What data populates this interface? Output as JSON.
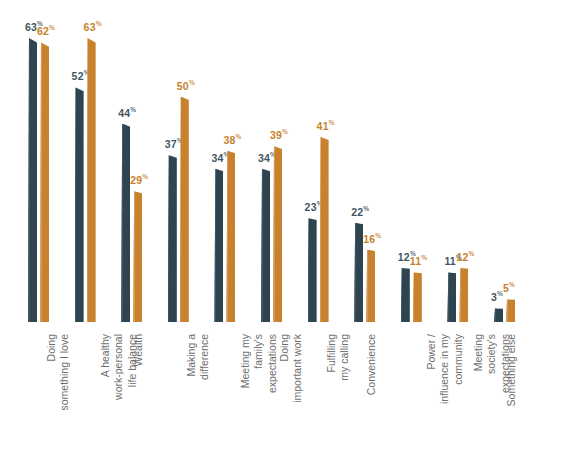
{
  "chart_data": {
    "type": "bar",
    "title": "",
    "subtitle": "",
    "xlabel": "",
    "ylabel": "",
    "ylim": [
      0,
      70
    ],
    "grid": false,
    "legend_position": "none",
    "value_suffix": "%",
    "categories": [
      "Doing something I love",
      "A healthy work-personal life balance",
      "Wealth",
      "Making a difference",
      "Meeting my family's expectations",
      "Doing important work",
      "Fulfilling my calling",
      "Convenience",
      "Power / influence in my community",
      "Meeting society's expectations",
      "Something else"
    ],
    "category_lines": [
      [
        "Doing",
        "something I love"
      ],
      [
        "A healthy",
        "work-personal",
        "life balance"
      ],
      [
        "Wealth"
      ],
      [
        "Making a",
        "difference"
      ],
      [
        "Meeting my",
        "family's",
        "expectations"
      ],
      [
        "Doing",
        "important work"
      ],
      [
        "Fulfilling",
        "my calling"
      ],
      [
        "Convenience"
      ],
      [
        "Power /",
        "influence in my",
        "community"
      ],
      [
        "Meeting",
        "society's",
        "expectations"
      ],
      [
        "Something else"
      ]
    ],
    "series": [
      {
        "name": "Series 1",
        "color": "#2e4450",
        "values": [
          63,
          52,
          44,
          37,
          34,
          34,
          23,
          22,
          12,
          11,
          3
        ]
      },
      {
        "name": "Series 2",
        "color": "#c8812c",
        "values": [
          62,
          63,
          29,
          50,
          38,
          39,
          41,
          16,
          11,
          12,
          5
        ]
      }
    ]
  },
  "colors": {
    "series_dark": "#2e4450",
    "series_orange": "#c8812c",
    "label_gray": "#6e6e6e",
    "value_dark": "#3f5562",
    "value_orange": "#c8812c",
    "background": "#ffffff"
  }
}
